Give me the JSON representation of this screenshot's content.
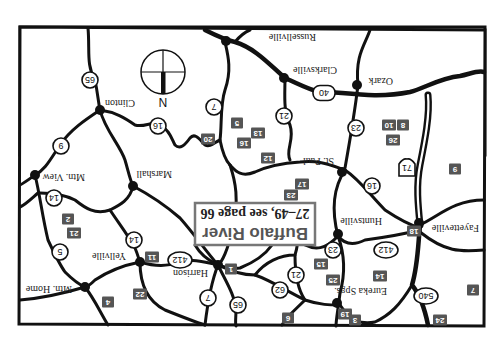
{
  "map": {
    "orientation": "upside-down",
    "callout": {
      "title": "Buffalo River",
      "subtitle": "27–49, see page 66"
    },
    "compass": {
      "label": "N"
    },
    "towns": [
      {
        "id": "russellville",
        "label": "Russellville"
      },
      {
        "id": "clarksville",
        "label": "Clarksville"
      },
      {
        "id": "ozark",
        "label": "Ozark"
      },
      {
        "id": "clinton",
        "label": "Clinton"
      },
      {
        "id": "st-paul",
        "label": "St. Paul"
      },
      {
        "id": "marshall",
        "label": "Marshall"
      },
      {
        "id": "mtn-view",
        "label": "Mtn. View"
      },
      {
        "id": "huntsville",
        "label": "Huntsville"
      },
      {
        "id": "fayetteville",
        "label": "Fayetteville"
      },
      {
        "id": "yellville",
        "label": "Yellville"
      },
      {
        "id": "harrison",
        "label": "Harrison"
      },
      {
        "id": "mtn-home",
        "label": "Mtn. Home"
      },
      {
        "id": "eureka-spgs",
        "label": "Eureka Spgs."
      }
    ],
    "route_shields": [
      "65",
      "7",
      "16",
      "9",
      "40",
      "21",
      "23",
      "71",
      "14",
      "16",
      "5",
      "14",
      "412",
      "412",
      "7",
      "65",
      "21",
      "62",
      "23",
      "540"
    ],
    "site_markers": [
      "5",
      "16",
      "13",
      "20",
      "12",
      "8",
      "10",
      "26",
      "9",
      "17",
      "23",
      "2",
      "21",
      "11",
      "18",
      "1",
      "15",
      "25",
      "14",
      "22",
      "4",
      "6",
      "19",
      "3",
      "24",
      "7"
    ]
  }
}
